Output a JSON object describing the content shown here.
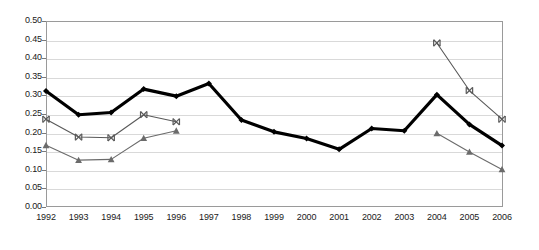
{
  "chart_data": {
    "type": "line",
    "title": "",
    "subtitle": "",
    "xlabel": "",
    "ylabel": "",
    "categories": [
      "1992",
      "1993",
      "1994",
      "1995",
      "1996",
      "1997",
      "1998",
      "1999",
      "2000",
      "2001",
      "2002",
      "2003",
      "2004",
      "2005",
      "2006"
    ],
    "ylim": [
      0.0,
      0.5
    ],
    "ytick_labels": [
      "0.50",
      "0.45",
      "0.40",
      "0.35",
      "0.30",
      "0.25",
      "0.20",
      "0.15",
      "0.10",
      "0.05",
      "0.00"
    ],
    "ytick_values": [
      0.5,
      0.45,
      0.4,
      0.35,
      0.3,
      0.25,
      0.2,
      0.15,
      0.1,
      0.05,
      0.0
    ],
    "ystep": 0.05,
    "grid": true,
    "legend": "none",
    "series": [
      {
        "name": "series-1",
        "marker": "diamond",
        "color": "#000000",
        "line_width": 3.2,
        "values": [
          0.312,
          0.248,
          0.254,
          0.317,
          0.298,
          0.332,
          0.234,
          0.202,
          0.184,
          0.155,
          0.211,
          0.205,
          0.302,
          0.222,
          0.165
        ]
      },
      {
        "name": "series-2",
        "marker": "cross",
        "color": "#595959",
        "line_width": 1.1,
        "values": [
          0.236,
          0.188,
          0.186,
          0.248,
          0.229,
          null,
          null,
          null,
          null,
          null,
          null,
          null,
          0.441,
          0.313,
          0.236
        ]
      },
      {
        "name": "series-3",
        "marker": "triangle",
        "color": "#6b6b6b",
        "line_width": 1.1,
        "values": [
          0.166,
          0.126,
          0.128,
          0.185,
          0.205,
          null,
          null,
          null,
          null,
          null,
          null,
          null,
          0.198,
          0.148,
          0.101
        ]
      }
    ]
  },
  "colors": {
    "plot_border": "#9a9a9a",
    "gridline": "#d9d9d9",
    "axis_text": "#1a1a1a",
    "background": "#ffffff"
  }
}
